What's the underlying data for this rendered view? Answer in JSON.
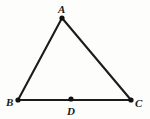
{
  "figure": {
    "kind": "geometry-diagram",
    "shape": "triangle",
    "background_color": "#fdfdfc",
    "stroke_color": "#1c1c1c",
    "dot_color": "#111111",
    "label_color": "#1a1a1a",
    "stroke_width": 2.1,
    "dot_radius": 2.6,
    "canvas": {
      "width": 150,
      "height": 119
    },
    "points": [
      {
        "id": "A",
        "label": "A",
        "x": 62,
        "y": 18,
        "dot": true,
        "label_x": 58,
        "label_y": 13,
        "role": "apex-vertex"
      },
      {
        "id": "B",
        "label": "B",
        "x": 18,
        "y": 100,
        "dot": true,
        "label_x": 6,
        "label_y": 106,
        "role": "left-vertex"
      },
      {
        "id": "C",
        "label": "C",
        "x": 131,
        "y": 100,
        "dot": true,
        "label_x": 135,
        "label_y": 107,
        "role": "right-vertex"
      },
      {
        "id": "D",
        "label": "D",
        "x": 71,
        "y": 99,
        "dot": true,
        "label_x": 67,
        "label_y": 115,
        "role": "point-on-base"
      }
    ],
    "edges": [
      {
        "id": "AB",
        "from": "A",
        "to": "B",
        "label": "AB"
      },
      {
        "id": "AC",
        "from": "A",
        "to": "C",
        "label": "AC"
      },
      {
        "id": "BC",
        "from": "B",
        "to": "C",
        "label": "BC"
      }
    ]
  }
}
